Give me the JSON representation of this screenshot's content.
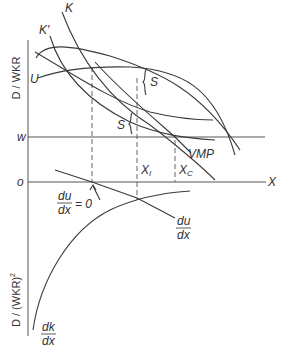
{
  "diagram": {
    "top_axis_label": "D / WKR",
    "bottom_axis_label": "D / (WKR)",
    "bottom_axis_exponent": "2",
    "level_w_label": "w",
    "level_o_label": "o",
    "x_axis_label": "X",
    "curves": {
      "K": "K",
      "K_prime": "K′",
      "U": "U",
      "VMP": "VMP",
      "du_dx_num": "du",
      "du_dx_den": "dx",
      "dk_dx_num": "dk",
      "dk_dx_den": "dx"
    },
    "brace_upper": "S",
    "brace_lower": "S",
    "markers": {
      "XI_base": "X",
      "XI_sub": "I",
      "XC_base": "X",
      "XC_sub": "C"
    },
    "annotation": {
      "num": "du",
      "den": "dx",
      "rhs": "= 0"
    },
    "colors": {
      "line": "#3a3a3a",
      "background": "#ffffff"
    }
  }
}
